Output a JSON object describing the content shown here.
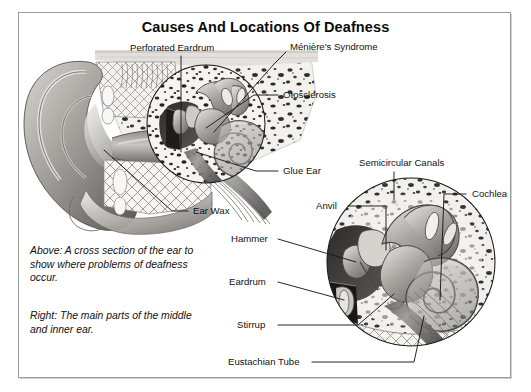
{
  "document": {
    "title": "Causes And Locations Of Deafness",
    "type": "anatomical-diagram",
    "subject": "human ear - causes and locations of deafness"
  },
  "main_diagram": {
    "name": "cross-section-of-ear",
    "labels": [
      {
        "id": "perforated-eardrum",
        "text": "Perforated Eardrum"
      },
      {
        "id": "menieres-syndrome",
        "text": "Ménière's Syndrome"
      },
      {
        "id": "otosclerosis",
        "text": "Otosclerosis"
      },
      {
        "id": "glue-ear",
        "text": "Glue Ear"
      },
      {
        "id": "ear-wax",
        "text": "Ear Wax"
      }
    ]
  },
  "inset_diagram": {
    "name": "middle-and-inner-ear-detail",
    "labels": [
      {
        "id": "semicircular-canals",
        "text": "Semicircular Canals"
      },
      {
        "id": "cochlea",
        "text": "Cochlea"
      },
      {
        "id": "anvil",
        "text": "Anvil"
      },
      {
        "id": "hammer",
        "text": "Hammer"
      },
      {
        "id": "eardrum",
        "text": "Eardrum"
      },
      {
        "id": "stirrup",
        "text": "Stirrup"
      },
      {
        "id": "eustachian-tube",
        "text": "Eustachian Tube"
      }
    ]
  },
  "captions": {
    "above": "Above: A cross section of the ear to show where problems of deafness occur.",
    "right": "Right: The main parts of the middle and inner ear."
  },
  "colors": {
    "frame": "#9a9a9a",
    "text": "#111111",
    "title": "#0b0b0b",
    "leader_line": "#1a1a1a",
    "page_background": "#ffffff",
    "artwork_midtone": "#9b9b9b",
    "artwork_shadow": "#3a3a3a",
    "artwork_highlight": "#e8e6e2"
  }
}
